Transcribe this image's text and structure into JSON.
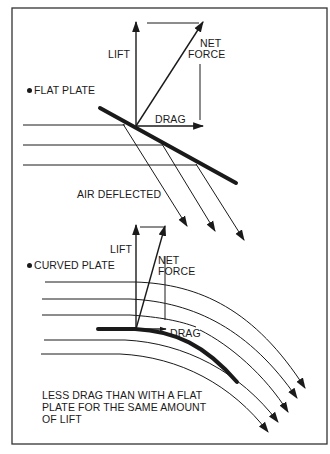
{
  "colors": {
    "ink": "#1a1a1a",
    "background": "#ffffff",
    "frame": "#333333"
  },
  "flat_plate": {
    "title": "FLAT PLATE",
    "lift_label": "LIFT",
    "net_force_label_line1": "NET",
    "net_force_label_line2": "FORCE",
    "drag_label": "DRAG",
    "air_label": "AIR DEFLECTED"
  },
  "curved_plate": {
    "title": "CURVED PLATE",
    "lift_label": "LIFT",
    "net_force_label_line1": "NET",
    "net_force_label_line2": "FORCE",
    "drag_label": "DRAG",
    "caption_line1": "LESS DRAG THAN WITH A FLAT",
    "caption_line2": "PLATE FOR THE SAME AMOUNT",
    "caption_line3": "OF LIFT"
  }
}
